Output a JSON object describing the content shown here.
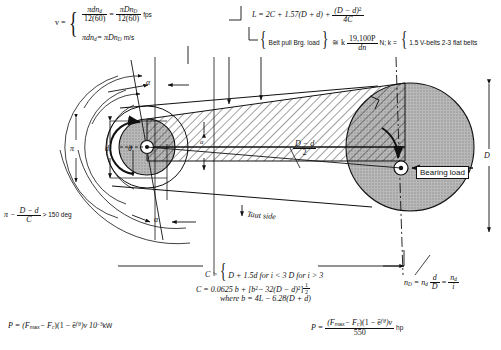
{
  "figure": {
    "type": "engineering-diagram"
  },
  "formulas": {
    "velocity_lhs": "v =",
    "velocity_line1_num": "πdn",
    "velocity_line1_num_sub": "d",
    "velocity_line1_den": "12(60)",
    "velocity_eq": "=",
    "velocity_line1_num2": "πDn",
    "velocity_line1_num2_sub": "D",
    "velocity_line1_den2": "12(60)",
    "velocity_units1": "fps",
    "velocity_line2": "πdn",
    "velocity_line2_sub": "d",
    "velocity_line2_eq": "= πDn",
    "velocity_line2_sub2": "D",
    "velocity_units2": "m/s",
    "length_lhs": "L = 2C + 1.57(D + d) +",
    "length_num": "(D − d)",
    "length_num_sup": "2",
    "length_den": "4C",
    "pull_item1": "Belt pull",
    "pull_item2": "Brg. load",
    "pull_rel": "≅ k",
    "pull_num": "19,100P",
    "pull_den": "dn",
    "pull_units": "N;  k =",
    "pull_k1": "1.5 V-belts",
    "pull_k2": "2-3 flat belts",
    "wrap_angle": "π −",
    "wrap_num": "D − d",
    "wrap_den": "C",
    "wrap_tail": "> 150 deg",
    "center_dist_lhs": "C >",
    "center_dist_1": "D + 1.5d for i < 3",
    "center_dist_2": "D for i > 3",
    "center_eq": "C = 0.0625",
    "center_eq_b": "b + [b",
    "center_eq_b_sup": "2",
    "center_eq_mid": "− 32(D − d)",
    "center_eq_mid_sup": "2",
    "center_eq_close": "]",
    "center_eq_exp_num": "1",
    "center_eq_exp_den": "2",
    "center_where": "where b = 4L − 6.28(D + d)",
    "speed_ratio_lhs": "n",
    "speed_ratio_lhs_sub": "D",
    "speed_ratio_eq1": "= n",
    "speed_ratio_eq1_sub": "d",
    "speed_ratio_frac1_num": "d",
    "speed_ratio_frac1_den": "D",
    "speed_ratio_eq2": "=",
    "speed_ratio_frac2_num": "n",
    "speed_ratio_frac2_num_sub": "d",
    "speed_ratio_frac2_den": "i",
    "power_kw": "P = (F",
    "power_kw_sub": "max",
    "power_kw_2": "− F",
    "power_kw_sub2": "c",
    "power_kw_3": ")(1 − ē",
    "power_kw_exp": "f′θ",
    "power_kw_4": ")v 10",
    "power_kw_exp2": "−3",
    "power_kw_units": "kW",
    "power_hp_lhs": "P =",
    "power_hp_num1": "(F",
    "power_hp_num1_sub": "max",
    "power_hp_num2": "− F",
    "power_hp_num2_sub": "c",
    "power_hp_num3": ")(1 − ē",
    "power_hp_num_exp": "f′θ",
    "power_hp_num4": ")v",
    "power_hp_den": "550",
    "power_hp_units": "hp"
  },
  "labels": {
    "alpha_top": "α",
    "alpha_bottom": "α",
    "alpha_center": "α",
    "pi_label": "π",
    "d_label": "d",
    "theta_label": "θ",
    "D_label": "D",
    "half_diff_num": "D − d",
    "half_diff_den": "2",
    "taut_side": "Taut side",
    "bearing_load": "Bearing load"
  },
  "colors": {
    "ink": "#111111",
    "pulley_fill": "#b9b9b9",
    "paper": "#ffffff"
  }
}
